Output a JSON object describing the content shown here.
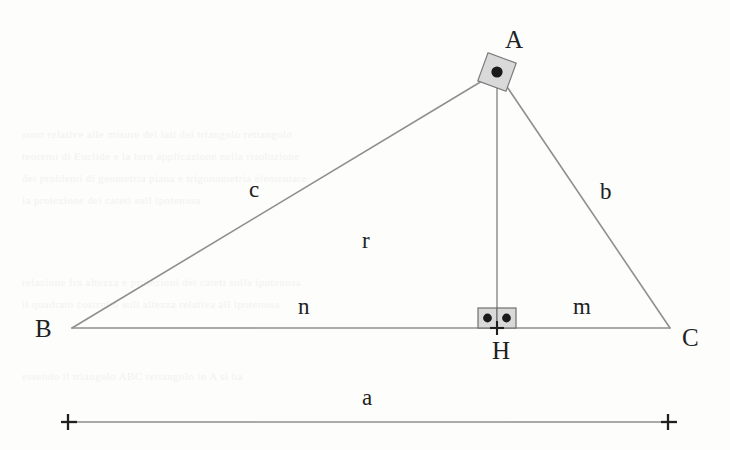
{
  "figure": {
    "type": "geometry-diagram",
    "background_color": "#fdfdfc",
    "line_color": "#8a8a8a",
    "marker_fill": "#d8d8d8",
    "marker_stroke": "#6f6f6f",
    "dot_color": "#1a1a1a",
    "text_color": "#212121"
  },
  "vertices": [
    {
      "name": "A",
      "label": "A",
      "x": 497,
      "y": 72,
      "label_x": 505,
      "label_y": 40,
      "has_right_angle": true
    },
    {
      "name": "B",
      "label": "B",
      "x": 72,
      "y": 328,
      "label_x": 42,
      "label_y": 331,
      "has_right_angle": false
    },
    {
      "name": "C",
      "label": "C",
      "x": 670,
      "y": 328,
      "label_x": 688,
      "label_y": 338,
      "has_right_angle": false
    },
    {
      "name": "H",
      "label": "H",
      "x": 497,
      "y": 328,
      "label_x": 502,
      "label_y": 353,
      "has_right_angle": true
    }
  ],
  "segments": [
    {
      "name": "side-c",
      "label": "c",
      "from": "B",
      "to": "A",
      "label_x": 255,
      "label_y": 190
    },
    {
      "name": "side-b",
      "label": "b",
      "from": "A",
      "to": "C",
      "label_x": 606,
      "label_y": 192
    },
    {
      "name": "side-a",
      "label": "a",
      "from": "B",
      "to": "C",
      "label_x": 368,
      "label_y": 398
    },
    {
      "name": "altitude-r",
      "label": "r",
      "from": "A",
      "to": "H",
      "label_x": 371,
      "label_y": 240
    },
    {
      "name": "projection-n",
      "label": "n",
      "from": "B",
      "to": "H",
      "label_x": 305,
      "label_y": 307
    },
    {
      "name": "projection-m",
      "label": "m",
      "from": "H",
      "to": "C",
      "label_x": 583,
      "label_y": 307
    }
  ],
  "dimension_line": {
    "name": "a-dimension",
    "label": "a",
    "x1": 68,
    "x2": 668,
    "y": 422,
    "end_marker": "plus-tick"
  },
  "right_angle_markers": [
    {
      "at": "A",
      "style": "rotated-square-with-dot",
      "count": 1
    },
    {
      "at": "H",
      "style": "square-with-dot",
      "count": 2
    }
  ],
  "bleed_through_lines": [
    {
      "text": "sono relative alle misure dei lati del triangolo rettangolo",
      "x": 22,
      "y": 128
    },
    {
      "text": "teoremi di Euclide e la loro applicazione nella risoluzione",
      "x": 22,
      "y": 150
    },
    {
      "text": "dei problemi di geometria piana e trigonometria elementare",
      "x": 22,
      "y": 172
    },
    {
      "text": "la proiezione dei cateti sull ipotenusa",
      "x": 22,
      "y": 194
    },
    {
      "text": "relazione fra altezza e proiezioni dei cateti sulla ipotenusa",
      "x": 22,
      "y": 276
    },
    {
      "text": "il quadrato costruito sull altezza relativa all ipotenusa",
      "x": 22,
      "y": 298
    },
    {
      "text": "essendo il triangolo ABC rettangolo in A si ha",
      "x": 22,
      "y": 370
    }
  ]
}
